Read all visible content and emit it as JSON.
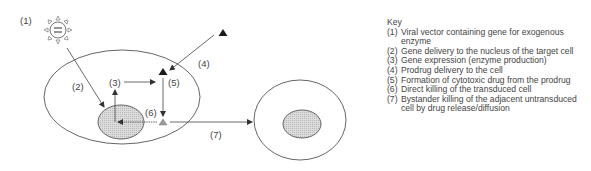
{
  "diagram": {
    "labels": {
      "l1": "(1)",
      "l2": "(2)",
      "l3": "(3)",
      "l4": "(4)",
      "l5": "(5)",
      "l6": "(6)",
      "l7": "(7)"
    },
    "icons": {
      "virus": "viral-vector-icon",
      "prodrug": "black-triangle-prodrug",
      "drug": "gray-triangle-cytotoxic-drug"
    },
    "colors": {
      "outline": "#555555",
      "nucleus_fill": "#d0d0d0",
      "prodrug": "#1a1a1a",
      "drug": "#9a9a9a"
    }
  },
  "key": {
    "title": "Key",
    "items": [
      {
        "num": "(1)",
        "text": "Viral vector containing gene for exogenous enzyme"
      },
      {
        "num": "(2)",
        "text": "Gene delivery to the nucleus of the target cell"
      },
      {
        "num": "(3)",
        "text": "Gene expression (enzyme production)"
      },
      {
        "num": "(4)",
        "text": "Prodrug delivery to the cell"
      },
      {
        "num": "(5)",
        "text": "Formation of cytotoxic drug from the prodrug"
      },
      {
        "num": "(6)",
        "text": "Direct killing of the transduced cell"
      },
      {
        "num": "(7)",
        "text": "Bystander killing of the adjacent untransduced cell by drug release/diffusion"
      }
    ]
  }
}
